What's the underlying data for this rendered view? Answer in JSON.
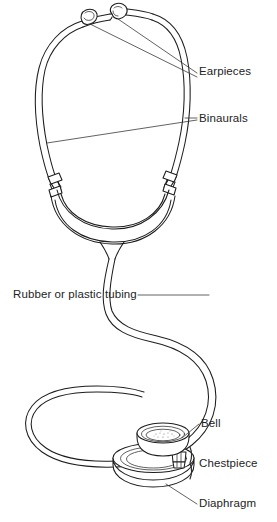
{
  "figure": {
    "background_color": "#ffffff",
    "ink_color": "#1d1d1f",
    "leader_color": "#3a3a3c"
  },
  "labels": {
    "earpieces": "Earpieces",
    "binaurals": "Binaurals",
    "tubing": "Rubber or plastic tubing",
    "bell": "Bell",
    "chestpiece": "Chestpiece",
    "diaphragm": "Diaphragm"
  },
  "parts": [
    {
      "name": "earpieces",
      "label": "Earpieces",
      "leader_count": 2
    },
    {
      "name": "binaurals",
      "label": "Binaurals",
      "leader_count": 2
    },
    {
      "name": "tubing",
      "label": "Rubber or plastic tubing",
      "leader_count": 1
    },
    {
      "name": "bell",
      "label": "Bell",
      "leader_count": 1
    },
    {
      "name": "chestpiece",
      "label": "Chestpiece",
      "leader_count": 0,
      "has_bracket": true
    },
    {
      "name": "diaphragm",
      "label": "Diaphragm",
      "leader_count": 1
    }
  ]
}
